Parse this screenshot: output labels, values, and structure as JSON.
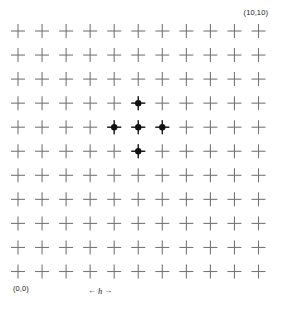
{
  "figure": {
    "width": 282,
    "height": 309,
    "background_color": "#ffffff"
  },
  "labels": {
    "origin": "(0,0)",
    "max": "(10,10)",
    "spacing_symbol": "h",
    "arrow_left": "←",
    "arrow_right": "→"
  },
  "chart_data": {
    "type": "scatter",
    "title": "",
    "xlabel": "",
    "ylabel": "",
    "grid": true,
    "legend": false,
    "xlim": [
      0,
      10
    ],
    "ylim": [
      0,
      10
    ],
    "x_ticks": [
      0,
      1,
      2,
      3,
      4,
      5,
      6,
      7,
      8,
      9,
      10
    ],
    "y_ticks": [
      0,
      1,
      2,
      3,
      4,
      5,
      6,
      7,
      8,
      9,
      10
    ],
    "grid_marker": "plus",
    "grid_marker_color": "#777777",
    "grid_points_cols": 11,
    "grid_points_rows": 11,
    "annotations": [
      {
        "text": "(0,0)",
        "position": "bottom-left"
      },
      {
        "text": "(10,10)",
        "position": "top-right"
      },
      {
        "text": "h",
        "position": "bottom-center",
        "note": "grid spacing indicator with left and right arrows"
      }
    ],
    "series": [
      {
        "name": "stencil-points",
        "marker": "filled-circle",
        "color": "#111111",
        "points": [
          {
            "x": 5,
            "y": 7
          },
          {
            "x": 4,
            "y": 6
          },
          {
            "x": 5,
            "y": 6
          },
          {
            "x": 6,
            "y": 6
          },
          {
            "x": 5,
            "y": 5
          }
        ]
      }
    ]
  }
}
